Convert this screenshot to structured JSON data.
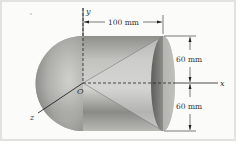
{
  "diagram": {
    "type": "engineering-figure",
    "axes": {
      "x": "x",
      "y": "y",
      "z": "z",
      "origin": "O"
    },
    "dimensions": {
      "length": "100 mm",
      "upper_radius": "60 mm",
      "lower_radius": "60 mm"
    },
    "colors": {
      "background": "#fbfbfa",
      "frame": "#e2e2e0",
      "solid_light": "#c9c9c6",
      "solid_dark": "#6f6f6c",
      "line": "#2a2a2a"
    }
  }
}
